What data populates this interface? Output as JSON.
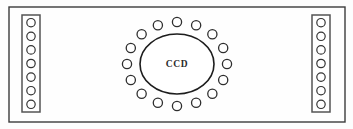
{
  "diagram": {
    "background_color": "#fdfdfd",
    "stroke_color": "#2e2e2e",
    "outer_frame": {
      "label": "outer-enclosure",
      "x": 9,
      "y": 7,
      "width": 336,
      "height": 115
    },
    "center": {
      "label": "CCD",
      "shape": "ellipse",
      "cx": 177,
      "cy": 64,
      "rx": 37,
      "ry": 30
    },
    "ring": {
      "label": "surrounding-detector-ring",
      "count": 16,
      "radius_x": 50,
      "radius_y": 42,
      "element_radius": 4.6,
      "start_angle_deg": -90
    },
    "left_tray": {
      "label": "left-module",
      "x": 22,
      "y": 15,
      "width": 18,
      "height": 97,
      "count": 7,
      "element_radius": 4.2
    },
    "right_tray": {
      "label": "right-module",
      "x": 312,
      "y": 15,
      "width": 18,
      "height": 97,
      "count": 7,
      "element_radius": 4.2
    }
  }
}
